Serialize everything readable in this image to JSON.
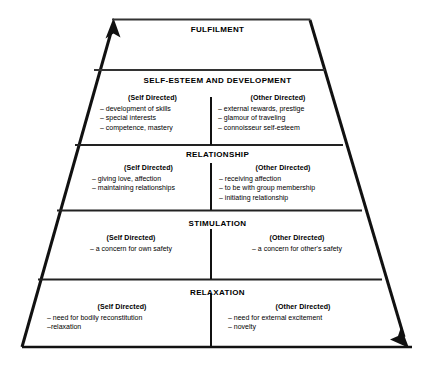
{
  "diagram": {
    "line_color": "#000000",
    "background_color": "#ffffff",
    "arrows": {
      "left_arrow_name": "up-arrow-icon",
      "right_arrow_name": "down-arrow-icon"
    },
    "column_headings": {
      "self": "(Self Directed)",
      "other": "(Other Directed)"
    },
    "tiers": [
      {
        "id": "fulfilment",
        "title": "FULFILMENT",
        "has_columns": false,
        "self_directed": [],
        "other_directed": []
      },
      {
        "id": "self-esteem-and-development",
        "title": "SELF-ESTEEM AND DEVELOPMENT",
        "has_columns": true,
        "self_heading": "(Self Directed)",
        "other_heading": "(Other Directed)",
        "self_directed": [
          "– development of skills",
          "– special interests",
          "– competence, mastery"
        ],
        "other_directed": [
          "– external rewards, prestige",
          "– glamour of traveling",
          "– connoisseur self-esteem"
        ]
      },
      {
        "id": "relationship",
        "title": "RELATIONSHIP",
        "has_columns": true,
        "self_heading": "(Self Directed)",
        "other_heading": "(Other Directed)",
        "self_directed": [
          "– giving love, affection",
          "– maintaining relationships"
        ],
        "other_directed": [
          "– receiving affection",
          "– to be with group membership",
          "– initiating relationship"
        ]
      },
      {
        "id": "stimulation",
        "title": "STIMULATION",
        "has_columns": true,
        "self_heading": "(Self Directed)",
        "other_heading": "(Other Directed)",
        "self_directed": [
          "– a concern for own safety"
        ],
        "other_directed": [
          "– a concern for other's safety"
        ]
      },
      {
        "id": "relaxation",
        "title": "RELAXATION",
        "has_columns": true,
        "self_heading": "(Self Directed)",
        "other_heading": "(Other Directed)",
        "self_directed": [
          "– need for bodily reconstitution",
          "–relaxation"
        ],
        "other_directed": [
          "– need for external excitement",
          "– novelty"
        ]
      }
    ]
  }
}
